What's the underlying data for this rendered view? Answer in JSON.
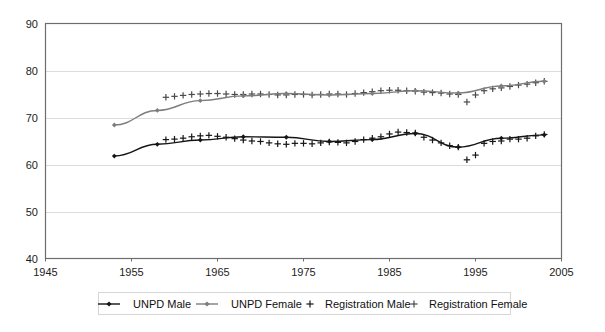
{
  "chart_data": {
    "type": "line",
    "title": "",
    "subtitle": "",
    "xlabel": "",
    "ylabel": "",
    "xlim": [
      1945,
      2005
    ],
    "ylim": [
      40,
      90
    ],
    "x_ticks": [
      1945,
      1955,
      1965,
      1975,
      1985,
      1995,
      2005
    ],
    "y_ticks": [
      40,
      50,
      60,
      70,
      80,
      90
    ],
    "grid": "horizontal",
    "legend_position": "bottom",
    "colors": {
      "unpd_male": "#151515",
      "unpd_female": "#7d7d7d",
      "registration_male": "#151515",
      "registration_female": "#4a4a4a",
      "grid": "#dcdcdc",
      "frame": "#6d6d6d",
      "background": "#ffffff"
    },
    "series": [
      {
        "name": "UNPD Male",
        "marker": "diamond",
        "style": "line",
        "x": [
          1953,
          1958,
          1963,
          1968,
          1973,
          1978,
          1983,
          1988,
          1993,
          1998,
          2003
        ],
        "values": [
          61.8,
          64.3,
          65.2,
          65.9,
          65.8,
          64.9,
          65.3,
          66.6,
          63.7,
          65.6,
          66.3
        ]
      },
      {
        "name": "UNPD Female",
        "marker": "diamond",
        "style": "line",
        "x": [
          1953,
          1958,
          1963,
          1968,
          1973,
          1978,
          1983,
          1988,
          1993,
          1998,
          2003
        ],
        "values": [
          68.4,
          71.5,
          73.6,
          74.6,
          75.1,
          74.8,
          75.1,
          75.7,
          75.2,
          76.7,
          77.7
        ]
      },
      {
        "name": "Registration Male",
        "marker": "plus",
        "style": "scatter",
        "x": [
          1959,
          1960,
          1961,
          1962,
          1963,
          1964,
          1965,
          1966,
          1967,
          1968,
          1969,
          1970,
          1971,
          1972,
          1973,
          1974,
          1975,
          1976,
          1977,
          1978,
          1979,
          1980,
          1981,
          1982,
          1983,
          1984,
          1985,
          1986,
          1987,
          1988,
          1989,
          1990,
          1991,
          1992,
          1993,
          1994,
          1995,
          1996,
          1997,
          1998,
          1999,
          2000,
          2001,
          2002,
          2003
        ],
        "values": [
          65.3,
          65.4,
          65.6,
          65.9,
          66.1,
          66.2,
          66.0,
          65.8,
          65.5,
          65.2,
          65.0,
          64.9,
          64.6,
          64.4,
          64.3,
          64.5,
          64.5,
          64.4,
          64.6,
          64.8,
          64.7,
          64.6,
          64.9,
          65.3,
          65.6,
          65.9,
          66.5,
          66.9,
          66.8,
          66.7,
          65.8,
          65.2,
          64.6,
          64.0,
          63.7,
          61.0,
          62.0,
          64.5,
          64.9,
          65.0,
          65.4,
          65.4,
          65.6,
          66.1,
          66.4
        ]
      },
      {
        "name": "Registration Female",
        "marker": "plus",
        "style": "scatter",
        "x": [
          1959,
          1960,
          1961,
          1962,
          1963,
          1964,
          1965,
          1966,
          1967,
          1968,
          1969,
          1970,
          1971,
          1972,
          1973,
          1974,
          1975,
          1976,
          1977,
          1978,
          1979,
          1980,
          1981,
          1982,
          1983,
          1984,
          1985,
          1986,
          1987,
          1988,
          1989,
          1990,
          1991,
          1992,
          1993,
          1994,
          1995,
          1996,
          1997,
          1998,
          1999,
          2000,
          2001,
          2002,
          2003
        ],
        "values": [
          74.3,
          74.5,
          74.7,
          74.9,
          75.0,
          75.1,
          75.1,
          75.0,
          74.9,
          74.9,
          75.0,
          75.0,
          74.9,
          74.8,
          74.8,
          74.9,
          74.9,
          74.8,
          74.9,
          75.0,
          75.0,
          74.9,
          75.1,
          75.3,
          75.5,
          75.7,
          75.8,
          75.8,
          75.7,
          75.6,
          75.4,
          75.3,
          75.2,
          75.0,
          74.9,
          73.3,
          74.8,
          75.7,
          76.1,
          76.3,
          76.6,
          76.9,
          77.1,
          77.4,
          77.7
        ]
      }
    ]
  },
  "axes": {
    "y_labels": [
      "90",
      "80",
      "70",
      "60",
      "50",
      "40"
    ],
    "x_labels": [
      "1945",
      "1955",
      "1965",
      "1975",
      "1985",
      "1995",
      "2005"
    ]
  },
  "legend": {
    "items": [
      {
        "label": "UNPD Male",
        "marker": "line-diamond",
        "color": "#151515"
      },
      {
        "label": "UNPD Female",
        "marker": "line-diamond",
        "color": "#7d7d7d"
      },
      {
        "label": "Registration Male",
        "marker": "plus",
        "color": "#151515"
      },
      {
        "label": "Registration Female",
        "marker": "plus",
        "color": "#4a4a4a"
      }
    ]
  }
}
